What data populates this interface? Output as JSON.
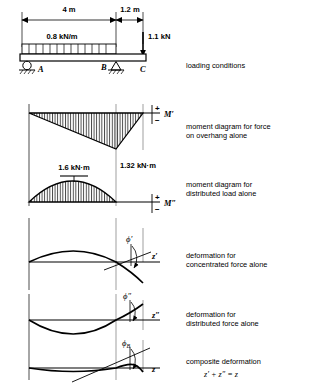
{
  "figure": {
    "type": "beam-superposition-diagram",
    "dimensions": {
      "span_ab": "4 m",
      "span_bc": "1.2 m"
    },
    "loads": {
      "distributed": "0.8 kN/m",
      "point": "1.1 kN"
    },
    "supports": [
      {
        "label": "A",
        "kind": "roller"
      },
      {
        "label": "B",
        "kind": "pin"
      },
      {
        "label": "C",
        "kind": "free-end"
      }
    ],
    "moment_values": {
      "distributed_max": "1.6 kN·m",
      "overhang_at_b": "1.32 kN·m"
    },
    "axis_labels": {
      "moment_primary": "M′",
      "moment_secondary": "M″",
      "sign_plus": "+",
      "sign_minus": "−",
      "slope_primary": "ϕ′",
      "slope_secondary": "ϕ″",
      "slope_composite": "ϕ",
      "slope_composite_sub": "B",
      "z_primary": "z′",
      "z_secondary": "z″",
      "z_composite": "z"
    },
    "captions": [
      {
        "id": "loading",
        "text": "loading conditions"
      },
      {
        "id": "moment-overhang",
        "text": "moment diagram for force\non overhang alone"
      },
      {
        "id": "moment-distributed",
        "text": "moment diagram for\ndistributed load alone"
      },
      {
        "id": "deform-concentrated",
        "text": "deformation for\nconcentrated force alone"
      },
      {
        "id": "deform-distributed",
        "text": "deformation for\ndistributed force alone"
      },
      {
        "id": "deform-composite",
        "text": "composite deformation"
      }
    ],
    "composite_equation": "z′ + z″ = z",
    "colors": {
      "ink": "#000000",
      "background": "#ffffff",
      "guide": "#8a8a8a"
    }
  }
}
